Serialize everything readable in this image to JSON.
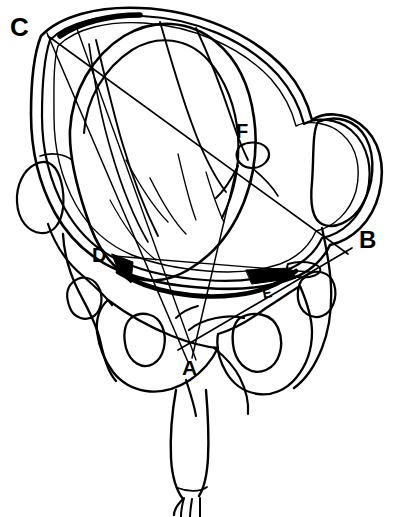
{
  "figure": {
    "kind": "anatomical-line-drawing",
    "background_color": "#ffffff",
    "ink_color": "#000000",
    "width": 398,
    "height": 517
  },
  "labels": {
    "a": "A",
    "b": "B",
    "c": "C",
    "d": "D",
    "e": "E",
    "f": "F"
  },
  "label_points": [
    {
      "id": "C",
      "text": "C",
      "x": 18,
      "y": 28,
      "role": "landmark-upper-left"
    },
    {
      "id": "F",
      "text": "F",
      "x": 245,
      "y": 135,
      "role": "landmark-fontanelle"
    },
    {
      "id": "B",
      "text": "B",
      "x": 368,
      "y": 242,
      "role": "landmark-right"
    },
    {
      "id": "D",
      "text": "D",
      "x": 103,
      "y": 257,
      "role": "landmark-left"
    },
    {
      "id": "E",
      "text": "E",
      "x": 267,
      "y": 297,
      "role": "landmark-ischial-spine"
    },
    {
      "id": "A",
      "text": "A",
      "x": 190,
      "y": 370,
      "role": "landmark-lower-center"
    }
  ],
  "measurement_lines": [
    {
      "id": "C-B",
      "from": "C",
      "to": "B",
      "description": "long oblique diameter from upper-left to right"
    },
    {
      "id": "C-A",
      "from": "C",
      "to": "A",
      "description": "long diameter from upper-left down to lower-centre"
    },
    {
      "id": "C2-A",
      "from": "C",
      "to": "A",
      "description": "second near-parallel diameter from upper-left down to lower-centre"
    },
    {
      "id": "D-B",
      "from": "D",
      "to": "B",
      "description": "transverse diameter from left to right"
    },
    {
      "id": "A-B",
      "from": "A",
      "to": "B",
      "description": "oblique diameter from lower-centre through E to right"
    },
    {
      "id": "F-A",
      "from": "F",
      "to": "A",
      "description": "short diameter from fontanelle down to lower-centre"
    }
  ],
  "anatomy_parts": [
    "pelvic-brim-outer",
    "pelvic-brim-inner",
    "fetal-head",
    "fetal-skull-sutures",
    "sacrum",
    "left-ilium",
    "right-ilium",
    "left-sacral-foramen",
    "right-sacral-foramen",
    "left-ischial-spine",
    "right-ischial-spine",
    "fetal-arm",
    "fetal-hand"
  ]
}
